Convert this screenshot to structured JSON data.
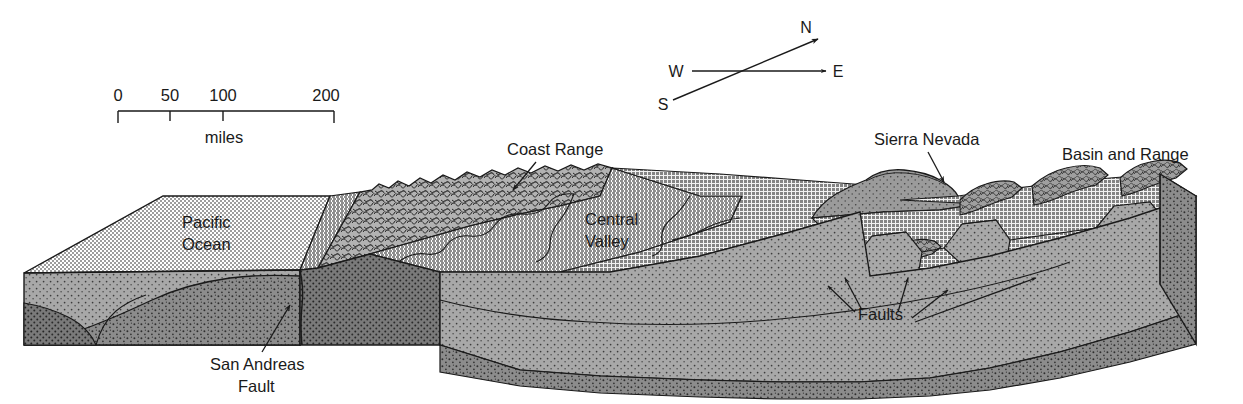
{
  "figure": {
    "kind": "geologic-block-diagram"
  },
  "scalebar": {
    "ticks": [
      "0",
      "50",
      "100",
      "200"
    ],
    "unit_label": "miles"
  },
  "compass": {
    "north": "N",
    "south": "S",
    "east": "E",
    "west": "W"
  },
  "labels": {
    "pacific_ocean_line1": "Pacific",
    "pacific_ocean_line2": "Ocean",
    "coast_range": "Coast Range",
    "central_valley_line1": "Central",
    "central_valley_line2": "Valley",
    "sierra_nevada": "Sierra Nevada",
    "basin_and_range": "Basin and Range",
    "san_andreas_line1": "San Andreas",
    "san_andreas_line2": "Fault",
    "faults": "Faults"
  },
  "colors": {
    "ink": "#1a1a1a",
    "ocean_surface": "#d2d2d2",
    "valley_surface": "#b4b4b4",
    "upland_surface": "#a6a6a6",
    "coast_range_band": "#b0b0b0",
    "front_face_light": "#a0a0a0",
    "front_face_dark": "#8a8a8a",
    "front_face_darkest": "#787878",
    "side_face": "#8f8f8f",
    "ridge_shade": "#9a9a9a",
    "paper": "#ffffff"
  }
}
